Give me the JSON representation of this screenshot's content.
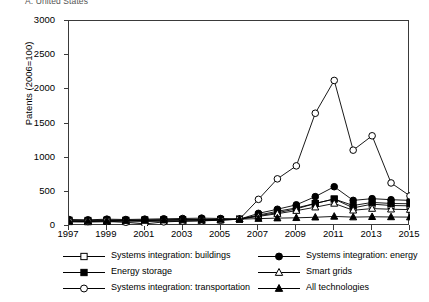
{
  "panel": {
    "title": "A. United States"
  },
  "axes": {
    "ylabel": "Patents (2006=100)",
    "yticks": [
      0,
      500,
      1000,
      1500,
      2000,
      2500,
      3000
    ],
    "ylim": [
      0,
      3000
    ],
    "xticks": [
      1997,
      1999,
      2001,
      2003,
      2005,
      2007,
      2009,
      2011,
      2013,
      2015
    ],
    "xlim": [
      1997,
      2015
    ],
    "xlabel": ""
  },
  "legend": {
    "position": "below-plot",
    "columns": 2,
    "entries": [
      {
        "label": "Systems integration: buildings",
        "marker": "open-square-marker",
        "column": 0,
        "row": 0
      },
      {
        "label": "Systems integration: energy",
        "marker": "filled-circle-marker",
        "column": 1,
        "row": 0
      },
      {
        "label": "Energy storage",
        "marker": "filled-square-marker",
        "column": 0,
        "row": 1
      },
      {
        "label": "Smart grids",
        "marker": "open-triangle-marker",
        "column": 1,
        "row": 1
      },
      {
        "label": "Systems integration: transportation",
        "marker": "open-circle-marker",
        "column": 0,
        "row": 2
      },
      {
        "label": "All technologies",
        "marker": "filled-triangle-marker",
        "column": 1,
        "row": 2
      }
    ]
  },
  "chart_data": {
    "type": "line",
    "title": "A. United States",
    "xlabel": "",
    "ylabel": "Patents (2006=100)",
    "xlim": [
      1997,
      2015
    ],
    "ylim": [
      0,
      3000
    ],
    "grid": false,
    "legend_position": "below",
    "x": [
      1997,
      1998,
      1999,
      2000,
      2001,
      2002,
      2003,
      2004,
      2005,
      2006,
      2007,
      2008,
      2009,
      2010,
      2011,
      2012,
      2013,
      2014,
      2015
    ],
    "series": [
      {
        "name": "Systems integration: buildings",
        "marker": "open-square-marker",
        "values": [
          75,
          70,
          80,
          78,
          82,
          85,
          88,
          90,
          95,
          100,
          150,
          195,
          250,
          330,
          395,
          265,
          320,
          300,
          295
        ]
      },
      {
        "name": "Systems integration: energy",
        "marker": "filled-circle-marker",
        "values": [
          95,
          90,
          100,
          95,
          100,
          105,
          110,
          115,
          110,
          100,
          185,
          245,
          310,
          430,
          575,
          375,
          400,
          385,
          375
        ]
      },
      {
        "name": "Energy storage",
        "marker": "filled-square-marker",
        "values": [
          85,
          82,
          88,
          85,
          90,
          92,
          95,
          98,
          97,
          100,
          160,
          215,
          265,
          330,
          395,
          300,
          345,
          330,
          325
        ]
      },
      {
        "name": "Smart grids",
        "marker": "open-triangle-marker",
        "values": [
          60,
          58,
          62,
          60,
          65,
          70,
          72,
          78,
          85,
          100,
          140,
          180,
          225,
          275,
          330,
          230,
          255,
          245,
          240
        ]
      },
      {
        "name": "Systems integration: transportation",
        "marker": "open-circle-marker",
        "values": [
          70,
          65,
          72,
          55,
          30,
          60,
          70,
          75,
          85,
          100,
          390,
          690,
          880,
          1650,
          2130,
          1110,
          1320,
          630,
          440
        ]
      },
      {
        "name": "All technologies",
        "marker": "filled-triangle-marker",
        "values": [
          70,
          72,
          75,
          78,
          80,
          85,
          88,
          92,
          96,
          100,
          108,
          115,
          120,
          128,
          140,
          130,
          135,
          132,
          130
        ]
      }
    ]
  }
}
